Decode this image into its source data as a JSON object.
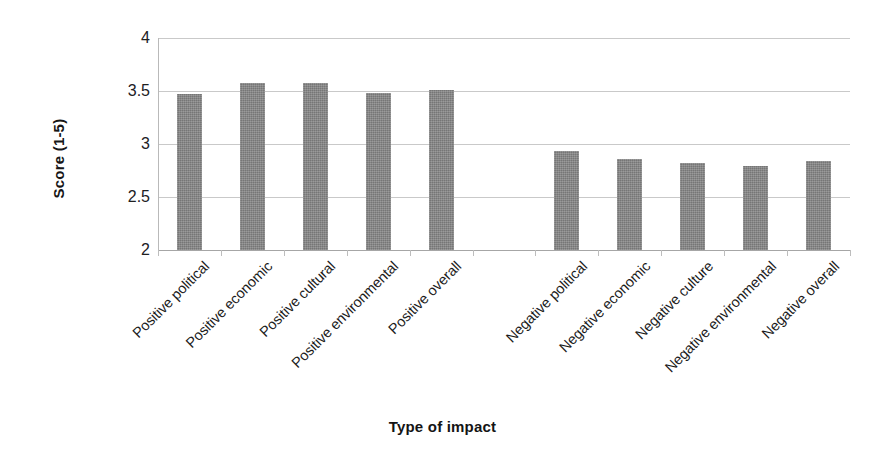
{
  "chart_data": {
    "type": "bar",
    "title": "",
    "xlabel": "Type of impact",
    "ylabel": "Score (1-5)",
    "ylim": [
      2,
      4
    ],
    "yticks": [
      2,
      2.5,
      3,
      3.5,
      4
    ],
    "ytick_labels": [
      "2",
      "2.5",
      "3",
      "3.5",
      "4"
    ],
    "grid": true,
    "legend": "none",
    "categories": [
      "Positive political",
      "Positive economic",
      "Positive cultural",
      "Positive environmental",
      "Positive overall",
      "",
      "Negative political",
      "Negative economic",
      "Negative culture",
      "Negative environmental",
      "Negative overall"
    ],
    "values": [
      3.47,
      3.58,
      3.58,
      3.48,
      3.51,
      null,
      2.93,
      2.86,
      2.82,
      2.79,
      2.84
    ],
    "series": [
      {
        "name": "Score",
        "color": "#818181",
        "points": [
          {
            "category": "Positive political",
            "value": 3.47
          },
          {
            "category": "Positive economic",
            "value": 3.58
          },
          {
            "category": "Positive cultural",
            "value": 3.58
          },
          {
            "category": "Positive environmental",
            "value": 3.48
          },
          {
            "category": "Positive overall",
            "value": 3.51
          },
          {
            "category": "Negative political",
            "value": 2.93
          },
          {
            "category": "Negative economic",
            "value": 2.86
          },
          {
            "category": "Negative culture",
            "value": 2.82
          },
          {
            "category": "Negative environmental",
            "value": 2.79
          },
          {
            "category": "Negative overall",
            "value": 2.84
          }
        ]
      }
    ],
    "colors": {
      "bar_fill": "#818181",
      "gridline": "#c9c9c9",
      "axis": "#b9b9b9",
      "text": "#1a1a1a",
      "background": "#ffffff"
    }
  }
}
